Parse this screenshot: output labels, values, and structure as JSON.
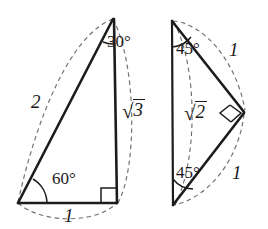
{
  "figure": {
    "caption": "",
    "background_color": "#ffffff",
    "line_color": "#1c1c1c",
    "dashed_arc_color": "#6e6e6e",
    "triangles": [
      {
        "name": "30-60-90-triangle",
        "angles": [
          "30°",
          "60°",
          "90°"
        ],
        "sides": [
          "2",
          "1",
          "√3"
        ]
      },
      {
        "name": "45-45-90-triangle",
        "angles": [
          "45°",
          "45°",
          "90°"
        ],
        "sides": [
          "1",
          "1",
          "√2"
        ]
      }
    ]
  },
  "left_triangle": {
    "name": "30-60-90-triangle",
    "angle_top": "30°",
    "angle_bottom_left": "60°",
    "angle_right_symbol": "right-angle",
    "side_hypotenuse": "2",
    "side_base": "1",
    "side_vertical_radical": "√",
    "side_vertical_value": "3"
  },
  "right_triangle": {
    "name": "45-45-90-triangle",
    "angle_top_left": "45°",
    "angle_bottom_left": "45°",
    "angle_right_symbol": "right-angle",
    "side_upper": "1",
    "side_lower": "1",
    "side_vertical_radical": "√",
    "side_vertical_value": "2"
  }
}
